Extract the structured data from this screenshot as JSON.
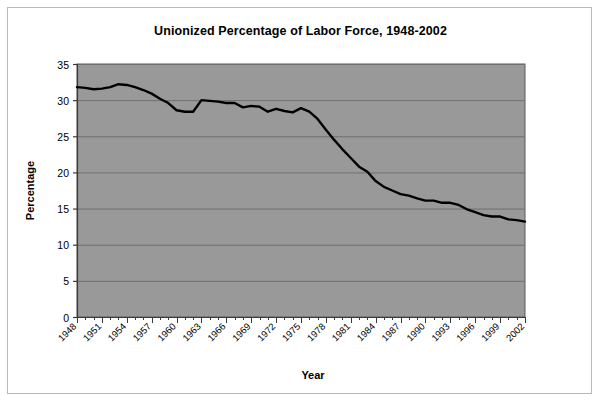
{
  "chart_data": {
    "type": "line",
    "title": "Unionized Percentage of Labor Force, 1948-2002",
    "xlabel": "Year",
    "ylabel": "Percentage",
    "ylim": [
      0,
      35
    ],
    "ytick_step": 5,
    "yticks": [
      0,
      5,
      10,
      15,
      20,
      25,
      30,
      35
    ],
    "xlim": [
      1948,
      2002
    ],
    "xtick_step": 3,
    "xticks": [
      1948,
      1951,
      1954,
      1957,
      1960,
      1963,
      1966,
      1969,
      1972,
      1975,
      1978,
      1981,
      1984,
      1987,
      1990,
      1993,
      1996,
      1999,
      2002
    ],
    "xtick_rotation": -45,
    "grid": "horizontal",
    "legend": "none",
    "plot_background": "#999999",
    "line_color": "#000000",
    "line_width": 2.4,
    "series": [
      {
        "name": "Unionized percentage of labor force",
        "x": [
          1948,
          1949,
          1950,
          1951,
          1952,
          1953,
          1954,
          1955,
          1956,
          1957,
          1958,
          1959,
          1960,
          1961,
          1962,
          1963,
          1964,
          1965,
          1966,
          1967,
          1968,
          1969,
          1970,
          1971,
          1972,
          1973,
          1974,
          1975,
          1976,
          1977,
          1978,
          1979,
          1980,
          1981,
          1982,
          1983,
          1984,
          1985,
          1986,
          1987,
          1988,
          1989,
          1990,
          1991,
          1992,
          1993,
          1994,
          1995,
          1996,
          1997,
          1998,
          1999,
          2000,
          2001,
          2002
        ],
        "values": [
          31.8,
          31.7,
          31.5,
          31.6,
          31.8,
          32.2,
          32.1,
          31.8,
          31.4,
          30.9,
          30.2,
          29.6,
          28.6,
          28.4,
          28.4,
          30.0,
          29.9,
          29.8,
          29.6,
          29.6,
          29.0,
          29.2,
          29.1,
          28.4,
          28.8,
          28.5,
          28.3,
          28.9,
          28.4,
          27.4,
          25.9,
          24.5,
          23.2,
          22.0,
          20.8,
          20.1,
          18.8,
          18.0,
          17.5,
          17.0,
          16.8,
          16.4,
          16.1,
          16.1,
          15.8,
          15.8,
          15.5,
          14.9,
          14.5,
          14.1,
          13.9,
          13.9,
          13.5,
          13.4,
          13.2
        ]
      }
    ]
  }
}
